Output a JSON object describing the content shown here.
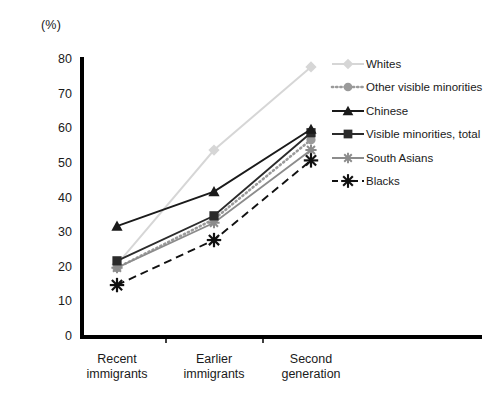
{
  "unit_label": "(%)",
  "axis": {
    "y_title": "Canadian identity",
    "y_ticks": [
      "0",
      "10",
      "20",
      "30",
      "40",
      "50",
      "60",
      "70",
      "80"
    ],
    "x_ticks": [
      {
        "line1": "Recent",
        "line2": "immigrants"
      },
      {
        "line1": "Earlier",
        "line2": "immigrants"
      },
      {
        "line1": "Second",
        "line2": "generation"
      }
    ]
  },
  "legend": {
    "items": [
      {
        "label": "Whites",
        "icon": "diamond-marker-icon",
        "color": "#d6d6d6"
      },
      {
        "label": "Other visible minorities",
        "icon": "circle-marker-icon",
        "color": "#9a9a9a"
      },
      {
        "label": "Chinese",
        "icon": "triangle-marker-icon",
        "color": "#1a1a1a"
      },
      {
        "label": "Visible minorities, total",
        "icon": "square-marker-icon",
        "color": "#2b2b2b"
      },
      {
        "label": "South Asians",
        "icon": "star-marker-icon",
        "color": "#8c8c8c"
      },
      {
        "label": "Blacks",
        "icon": "asterisk-marker-icon",
        "color": "#111111"
      }
    ]
  },
  "chart_data": {
    "type": "line",
    "title": "",
    "xlabel": "",
    "ylabel": "Canadian identity",
    "unit": "(%)",
    "categories": [
      "Recent immigrants",
      "Earlier immigrants",
      "Second generation"
    ],
    "ylim": [
      0,
      80
    ],
    "ytick_step": 10,
    "grid": false,
    "legend_position": "right",
    "series": [
      {
        "name": "Whites",
        "values": [
          21,
          54,
          78
        ],
        "color": "#d6d6d6",
        "marker": "diamond",
        "dash": "solid"
      },
      {
        "name": "Other visible minorities",
        "values": [
          20,
          34,
          57
        ],
        "color": "#9a9a9a",
        "marker": "circle",
        "dash": "dotted"
      },
      {
        "name": "Chinese",
        "values": [
          32,
          42,
          60
        ],
        "color": "#1a1a1a",
        "marker": "triangle",
        "dash": "solid"
      },
      {
        "name": "Visible minorities, total",
        "values": [
          22,
          35,
          59
        ],
        "color": "#2b2b2b",
        "marker": "square",
        "dash": "solid"
      },
      {
        "name": "South Asians",
        "values": [
          20,
          33,
          54
        ],
        "color": "#8c8c8c",
        "marker": "star",
        "dash": "solid"
      },
      {
        "name": "Blacks",
        "values": [
          15,
          28,
          51
        ],
        "color": "#111111",
        "marker": "asterisk",
        "dash": "dashed"
      }
    ]
  }
}
